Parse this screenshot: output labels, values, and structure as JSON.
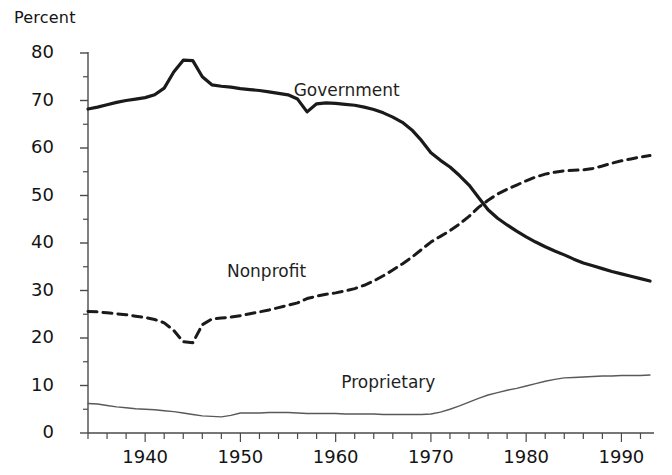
{
  "chart_data": {
    "type": "line",
    "title": "",
    "subtitle": "",
    "xlabel": "",
    "ylabel": "Percent",
    "xlim": [
      1934,
      1993
    ],
    "ylim": [
      0,
      80
    ],
    "grid": false,
    "legend_position": "inline-annotations",
    "y_ticks": [
      0,
      10,
      20,
      30,
      40,
      50,
      60,
      70,
      80
    ],
    "y_tick_labels": [
      "0",
      "10",
      "20",
      "30",
      "40",
      "50",
      "60",
      "70",
      "80"
    ],
    "y_minor_ticks": [
      5,
      15,
      25,
      35,
      45,
      55,
      65,
      75
    ],
    "x_ticks": [
      1940,
      1950,
      1960,
      1970,
      1980,
      1990
    ],
    "x_tick_labels": [
      "1940",
      "1950",
      "1960",
      "1970",
      "1980",
      "1990"
    ],
    "x_minor_tick_step": 2,
    "x": [
      1934,
      1935,
      1936,
      1937,
      1938,
      1939,
      1940,
      1941,
      1942,
      1943,
      1944,
      1945,
      1946,
      1947,
      1948,
      1949,
      1950,
      1951,
      1952,
      1953,
      1954,
      1955,
      1956,
      1957,
      1958,
      1959,
      1960,
      1961,
      1962,
      1963,
      1964,
      1965,
      1966,
      1967,
      1968,
      1969,
      1970,
      1971,
      1972,
      1973,
      1974,
      1975,
      1976,
      1977,
      1978,
      1979,
      1980,
      1981,
      1982,
      1983,
      1984,
      1985,
      1986,
      1987,
      1988,
      1989,
      1990,
      1991,
      1992,
      1993
    ],
    "series": [
      {
        "name": "Government",
        "style": "solid",
        "color": "#1a1a1a",
        "width": 3.2,
        "label_x": 1960,
        "label_y": 72,
        "values": [
          68.2,
          68.6,
          69.1,
          69.6,
          70.0,
          70.3,
          70.6,
          71.2,
          72.6,
          76.0,
          78.5,
          78.4,
          75.0,
          73.3,
          73.0,
          72.8,
          72.5,
          72.3,
          72.1,
          71.8,
          71.5,
          71.2,
          70.3,
          67.6,
          69.3,
          69.5,
          69.4,
          69.2,
          69.0,
          68.6,
          68.1,
          67.4,
          66.5,
          65.4,
          63.8,
          61.6,
          59.0,
          57.4,
          56.0,
          54.2,
          52.2,
          49.6,
          47.0,
          45.2,
          43.8,
          42.5,
          41.3,
          40.2,
          39.2,
          38.3,
          37.5,
          36.6,
          35.8,
          35.2,
          34.6,
          34.0,
          33.5,
          33.0,
          32.5,
          32.0
        ]
      },
      {
        "name": "Nonprofit",
        "style": "dashed",
        "color": "#1a1a1a",
        "width": 3.0,
        "label_x": 1953,
        "label_y": 34,
        "values": [
          25.6,
          25.5,
          25.3,
          25.1,
          24.9,
          24.6,
          24.3,
          23.9,
          23.2,
          21.6,
          19.2,
          19.0,
          22.8,
          24.0,
          24.2,
          24.4,
          24.7,
          25.1,
          25.5,
          25.9,
          26.4,
          26.9,
          27.4,
          28.3,
          28.8,
          29.2,
          29.5,
          29.9,
          30.4,
          31.1,
          32.0,
          33.1,
          34.3,
          35.6,
          37.0,
          38.6,
          40.2,
          41.4,
          42.6,
          44.0,
          45.6,
          47.5,
          49.0,
          50.3,
          51.3,
          52.2,
          53.1,
          53.9,
          54.5,
          54.9,
          55.2,
          55.3,
          55.4,
          55.7,
          56.2,
          56.8,
          57.3,
          57.7,
          58.1,
          58.4
        ]
      },
      {
        "name": "Proprietary",
        "style": "solid",
        "color": "#595959",
        "width": 1.4,
        "label_x": 1965,
        "label_y": 10.5,
        "values": [
          6.2,
          6.1,
          5.8,
          5.5,
          5.3,
          5.1,
          5.0,
          4.9,
          4.7,
          4.5,
          4.2,
          3.9,
          3.6,
          3.5,
          3.4,
          3.7,
          4.2,
          4.2,
          4.2,
          4.3,
          4.3,
          4.3,
          4.2,
          4.1,
          4.1,
          4.1,
          4.1,
          4.0,
          4.0,
          4.0,
          4.0,
          3.9,
          3.9,
          3.9,
          3.9,
          3.9,
          4.0,
          4.4,
          5.0,
          5.7,
          6.5,
          7.3,
          8.0,
          8.5,
          9.0,
          9.4,
          9.9,
          10.4,
          10.9,
          11.3,
          11.6,
          11.7,
          11.8,
          11.9,
          12.0,
          12.0,
          12.1,
          12.1,
          12.1,
          12.2
        ]
      }
    ]
  },
  "axes": {
    "y_title": "Percent"
  }
}
